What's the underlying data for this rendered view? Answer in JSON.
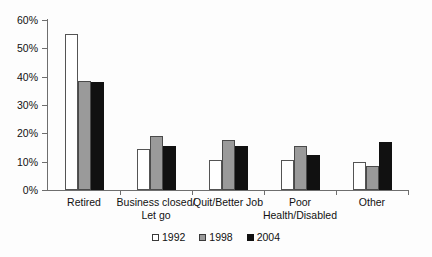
{
  "chart_data": {
    "type": "bar",
    "title": "",
    "subtitle": "",
    "xlabel": "",
    "ylabel": "",
    "ylim": [
      0,
      60
    ],
    "ytick_labels": [
      "0%",
      "10%",
      "20%",
      "30%",
      "40%",
      "50%",
      "60%"
    ],
    "ytick_values": [
      0,
      10,
      20,
      30,
      40,
      50,
      60
    ],
    "grid": false,
    "legend_position": "bottom-center",
    "value_suffix": "%",
    "categories": [
      "Retired",
      "Business closed/\nLet go",
      "Quit/Better Job",
      "Poor\nHealth/Disabled",
      "Other"
    ],
    "series": [
      {
        "name": "1992",
        "color": "#ffffff",
        "values": [
          55,
          14.5,
          10.5,
          10.5,
          10
        ]
      },
      {
        "name": "1998",
        "color": "#9a9a9a",
        "values": [
          38.5,
          19,
          17.5,
          15.5,
          8.5
        ]
      },
      {
        "name": "2004",
        "color": "#111111",
        "values": [
          38,
          15.5,
          15.5,
          12.5,
          17
        ]
      }
    ]
  },
  "legend": {
    "items": [
      {
        "label": "1992"
      },
      {
        "label": "1998"
      },
      {
        "label": "2004"
      }
    ]
  },
  "colors": {
    "series_1992": "#ffffff",
    "series_1998": "#9a9a9a",
    "series_2004": "#111111",
    "axis": "#6e6e6e",
    "text": "#111111",
    "background": "#fdfdfd"
  }
}
